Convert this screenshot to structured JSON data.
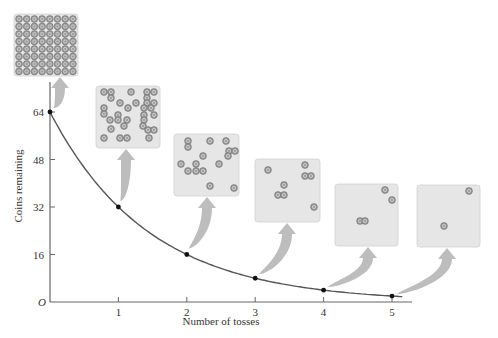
{
  "chart_data": {
    "type": "line",
    "title": "",
    "xlabel": "Number of tosses",
    "ylabel": "Coins remaining",
    "origin_label": "O",
    "x": [
      0,
      1,
      2,
      3,
      4,
      5
    ],
    "series": [
      {
        "name": "Coins remaining",
        "values": [
          64,
          32,
          16,
          8,
          4,
          2
        ]
      }
    ],
    "x_ticks": [
      "1",
      "2",
      "3",
      "4",
      "5"
    ],
    "y_ticks": [
      "16",
      "32",
      "48",
      "64"
    ],
    "xlim": [
      0,
      5.3
    ],
    "ylim": [
      0,
      72
    ],
    "grid": false,
    "legend": "none",
    "insets": [
      {
        "toss": 0,
        "coins": 64,
        "description": "8x8 grid of coins"
      },
      {
        "toss": 1,
        "coins": 32
      },
      {
        "toss": 2,
        "coins": 16
      },
      {
        "toss": 3,
        "coins": 8
      },
      {
        "toss": 4,
        "coins": 4
      },
      {
        "toss": 5,
        "coins": 2
      }
    ]
  },
  "colors": {
    "curve": "#555555",
    "axis": "#666666",
    "point": "#111111",
    "box_fill": "#e6e6e6",
    "box_stroke": "#d0d0d0",
    "arrow": "#bdbdbd",
    "coin_fill": "#9a9a9a",
    "coin_stroke": "#6e6e6e"
  },
  "icons": {
    "coin": "coin-icon",
    "arrow": "curved-arrow-icon"
  }
}
